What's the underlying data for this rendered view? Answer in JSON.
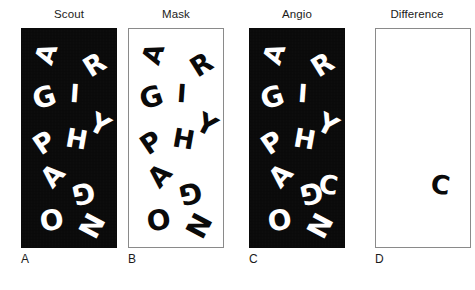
{
  "figure": {
    "caption_letters": [
      "A",
      "B",
      "C",
      "D"
    ],
    "colors": {
      "panel_dark_bg": "#0a0a0a",
      "panel_light_bg": "#ffffff",
      "panel_border": "#8a8a8a",
      "glyph_light": "#ffffff",
      "glyph_dark": "#0a0a0a",
      "text": "#1b1b1b"
    },
    "panels": [
      {
        "id": "scout",
        "title": "Scout",
        "label": "A",
        "background": "dark",
        "x": 21,
        "title_center_x": 69,
        "glyphs": [
          {
            "char": "A",
            "x": 14,
            "y": 12,
            "size": 26,
            "rot": -72
          },
          {
            "char": "R",
            "x": 62,
            "y": 22,
            "size": 27,
            "rot": -32
          },
          {
            "char": "G",
            "x": 11,
            "y": 55,
            "size": 28,
            "rot": -18
          },
          {
            "char": "I",
            "x": 48,
            "y": 52,
            "size": 25,
            "rot": 4
          },
          {
            "char": "Y",
            "x": 68,
            "y": 82,
            "size": 27,
            "rot": 28
          },
          {
            "char": "P",
            "x": 12,
            "y": 100,
            "size": 27,
            "rot": -34
          },
          {
            "char": "H",
            "x": 44,
            "y": 97,
            "size": 26,
            "rot": 10
          },
          {
            "char": "A",
            "x": 20,
            "y": 133,
            "size": 27,
            "rot": -48
          },
          {
            "char": "G",
            "x": 50,
            "y": 150,
            "size": 28,
            "rot": 168
          },
          {
            "char": "O",
            "x": 18,
            "y": 178,
            "size": 28,
            "rot": -8
          },
          {
            "char": "N",
            "x": 57,
            "y": 182,
            "size": 28,
            "rot": 118
          }
        ]
      },
      {
        "id": "mask",
        "title": "Mask",
        "label": "B",
        "background": "light",
        "x": 128,
        "title_center_x": 176,
        "glyphs": [
          {
            "char": "A",
            "x": 14,
            "y": 12,
            "size": 26,
            "rot": -72
          },
          {
            "char": "R",
            "x": 62,
            "y": 22,
            "size": 27,
            "rot": -32
          },
          {
            "char": "G",
            "x": 11,
            "y": 55,
            "size": 28,
            "rot": -18
          },
          {
            "char": "I",
            "x": 48,
            "y": 52,
            "size": 25,
            "rot": 4
          },
          {
            "char": "Y",
            "x": 68,
            "y": 82,
            "size": 27,
            "rot": 28
          },
          {
            "char": "P",
            "x": 12,
            "y": 100,
            "size": 27,
            "rot": -34
          },
          {
            "char": "H",
            "x": 44,
            "y": 97,
            "size": 26,
            "rot": 10
          },
          {
            "char": "A",
            "x": 20,
            "y": 133,
            "size": 27,
            "rot": -48
          },
          {
            "char": "G",
            "x": 50,
            "y": 150,
            "size": 28,
            "rot": 168
          },
          {
            "char": "O",
            "x": 18,
            "y": 178,
            "size": 28,
            "rot": -8
          },
          {
            "char": "N",
            "x": 57,
            "y": 182,
            "size": 28,
            "rot": 118
          }
        ]
      },
      {
        "id": "angio",
        "title": "Angio",
        "label": "C",
        "background": "dark",
        "x": 249,
        "title_center_x": 297,
        "glyphs": [
          {
            "char": "A",
            "x": 14,
            "y": 12,
            "size": 26,
            "rot": -72
          },
          {
            "char": "R",
            "x": 62,
            "y": 22,
            "size": 27,
            "rot": -32
          },
          {
            "char": "G",
            "x": 11,
            "y": 55,
            "size": 28,
            "rot": -18
          },
          {
            "char": "I",
            "x": 48,
            "y": 52,
            "size": 25,
            "rot": 4
          },
          {
            "char": "Y",
            "x": 68,
            "y": 82,
            "size": 27,
            "rot": 28
          },
          {
            "char": "P",
            "x": 12,
            "y": 100,
            "size": 27,
            "rot": -34
          },
          {
            "char": "H",
            "x": 44,
            "y": 97,
            "size": 26,
            "rot": 10
          },
          {
            "char": "A",
            "x": 20,
            "y": 133,
            "size": 27,
            "rot": -48
          },
          {
            "char": "G",
            "x": 50,
            "y": 150,
            "size": 28,
            "rot": 168
          },
          {
            "char": "C",
            "x": 69,
            "y": 143,
            "size": 26,
            "rot": 8
          },
          {
            "char": "O",
            "x": 18,
            "y": 178,
            "size": 28,
            "rot": -8
          },
          {
            "char": "N",
            "x": 57,
            "y": 182,
            "size": 28,
            "rot": 118
          }
        ]
      },
      {
        "id": "difference",
        "title": "Difference",
        "label": "D",
        "background": "light",
        "x": 375,
        "title_center_x": 417,
        "glyphs": [
          {
            "char": "C",
            "x": 55,
            "y": 143,
            "size": 26,
            "rot": 8
          }
        ]
      }
    ],
    "title_y": 8,
    "panel_top": 28,
    "panel_height": 220,
    "panel_width": 96,
    "label_y": 252
  }
}
